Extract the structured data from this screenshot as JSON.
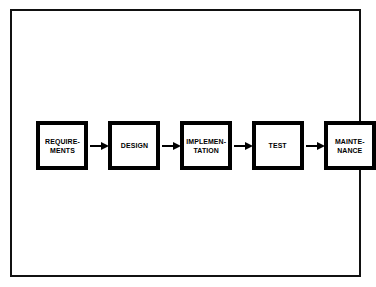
{
  "figure": {
    "background_color": "#ffffff",
    "line_color": "#000000",
    "frame_color": "#111111"
  },
  "diagram": {
    "type": "linear-process-flow",
    "orientation": "left-to-right",
    "stage_count": 5,
    "arrow_count": 4,
    "stages": [
      {
        "id": "requirements",
        "lines": [
          "REQUIRE-",
          "MENTS"
        ]
      },
      {
        "id": "design",
        "lines": [
          "DESIGN"
        ]
      },
      {
        "id": "implementation",
        "lines": [
          "IMPLEMEN-",
          "TATION"
        ]
      },
      {
        "id": "test",
        "lines": [
          "TEST"
        ]
      },
      {
        "id": "maintenance",
        "lines": [
          "MAINTE-",
          "NANCE"
        ]
      }
    ],
    "arrows": [
      {
        "id": "arrow-requirements-to-design",
        "direction": "right"
      },
      {
        "id": "arrow-design-to-implementation",
        "direction": "right"
      },
      {
        "id": "arrow-implementation-to-test",
        "direction": "right"
      },
      {
        "id": "arrow-test-to-maintenance",
        "direction": "right"
      }
    ]
  }
}
